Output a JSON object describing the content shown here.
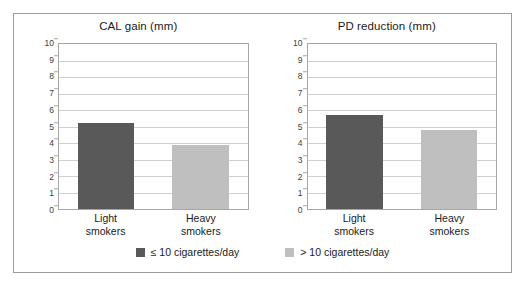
{
  "figure": {
    "series_colors": {
      "light_smokers": "#595959",
      "heavy_smokers": "#bfbfbf"
    },
    "legend": [
      {
        "label": "≤ 10 cigarettes/day",
        "color": "#595959",
        "swatch_name": "legend-swatch-light-smokers"
      },
      {
        "label": "> 10 cigarettes/day",
        "color": "#bfbfbf",
        "swatch_name": "legend-swatch-heavy-smokers"
      }
    ]
  },
  "chart_data": [
    {
      "type": "bar",
      "title": "CAL gain (mm)",
      "xlabel": "",
      "ylabel": "",
      "ylim": [
        0,
        10
      ],
      "ytick_step": 1,
      "yticks": [
        "10",
        "9",
        "8",
        "7",
        "6",
        "5",
        "4",
        "3",
        "2",
        "1",
        "0"
      ],
      "grid": true,
      "legend_position": "bottom",
      "categories": [
        "Light smokers",
        "Heavy smokers"
      ],
      "category_lines": [
        [
          "Light",
          "smokers"
        ],
        [
          "Heavy",
          "smokers"
        ]
      ],
      "values": [
        5.2,
        3.9
      ],
      "bar_colors": [
        "#595959",
        "#bfbfbf"
      ]
    },
    {
      "type": "bar",
      "title": "PD reduction (mm)",
      "xlabel": "",
      "ylabel": "",
      "ylim": [
        0,
        10
      ],
      "ytick_step": 1,
      "yticks": [
        "10",
        "9",
        "8",
        "7",
        "6",
        "5",
        "4",
        "3",
        "2",
        "1",
        "0"
      ],
      "grid": true,
      "legend_position": "bottom",
      "categories": [
        "Light smokers",
        "Heavy smokers"
      ],
      "category_lines": [
        [
          "Light",
          "smokers"
        ],
        [
          "Heavy",
          "smokers"
        ]
      ],
      "values": [
        5.7,
        4.8
      ],
      "bar_colors": [
        "#595959",
        "#bfbfbf"
      ]
    }
  ]
}
